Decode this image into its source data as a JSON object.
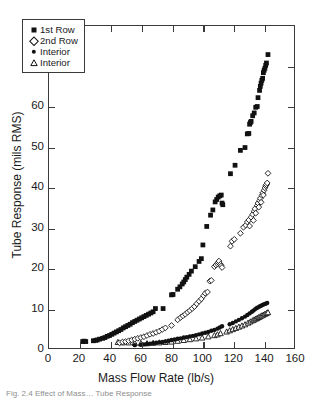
{
  "figure": {
    "caption": "Fig. 2.4  Effect of Mass…  Tube Response"
  },
  "chart_data": {
    "type": "scatter",
    "title": "",
    "xlabel": "Mass Flow Rate (lb/s)",
    "ylabel": "Tube Response (mils RMS)",
    "xlim": [
      0,
      160
    ],
    "ylim": [
      0,
      80
    ],
    "xticks": [
      0,
      20,
      40,
      60,
      80,
      100,
      120,
      140,
      160
    ],
    "yticks": [
      0,
      10,
      20,
      30,
      40,
      50,
      60,
      70,
      80
    ],
    "grid": false,
    "legend_position": "upper left",
    "series": [
      {
        "name": "1st Row",
        "marker": "filled-square",
        "color": "#111111",
        "points": [
          [
            22.0,
            1.6
          ],
          [
            23.0,
            1.7
          ],
          [
            24.0,
            1.6
          ],
          [
            29.0,
            1.8
          ],
          [
            30.5,
            1.9
          ],
          [
            31.5,
            2.0
          ],
          [
            33.0,
            2.2
          ],
          [
            35.0,
            2.4
          ],
          [
            36.5,
            2.6
          ],
          [
            38.0,
            2.9
          ],
          [
            39.5,
            3.1
          ],
          [
            41.0,
            3.4
          ],
          [
            42.5,
            3.7
          ],
          [
            44.0,
            4.0
          ],
          [
            45.5,
            4.3
          ],
          [
            47.0,
            4.6
          ],
          [
            48.5,
            5.0
          ],
          [
            50.0,
            5.3
          ],
          [
            51.5,
            5.6
          ],
          [
            53.0,
            5.9
          ],
          [
            54.5,
            6.3
          ],
          [
            56.0,
            6.6
          ],
          [
            57.5,
            6.9
          ],
          [
            59.0,
            7.2
          ],
          [
            60.5,
            7.5
          ],
          [
            62.0,
            7.8
          ],
          [
            63.5,
            8.1
          ],
          [
            65.0,
            8.4
          ],
          [
            66.5,
            8.7
          ],
          [
            68.0,
            9.0
          ],
          [
            69.5,
            9.8
          ],
          [
            74.5,
            9.8
          ],
          [
            80.0,
            13.2
          ],
          [
            81.0,
            13.3
          ],
          [
            84.0,
            14.6
          ],
          [
            85.5,
            15.2
          ],
          [
            87.0,
            15.9
          ],
          [
            88.0,
            16.4
          ],
          [
            89.0,
            17.0
          ],
          [
            90.0,
            17.6
          ],
          [
            91.5,
            18.3
          ],
          [
            93.0,
            19.1
          ],
          [
            95.5,
            20.2
          ],
          [
            98.0,
            21.5
          ],
          [
            99.5,
            22.2
          ],
          [
            100.5,
            25.6
          ],
          [
            103.0,
            30.2
          ],
          [
            105.5,
            33.0
          ],
          [
            107.0,
            34.3
          ],
          [
            108.5,
            36.3
          ],
          [
            109.5,
            36.9
          ],
          [
            110.5,
            37.5
          ],
          [
            111.5,
            37.8
          ],
          [
            112.5,
            38.0
          ],
          [
            113.0,
            36.0
          ],
          [
            113.5,
            35.6
          ],
          [
            118.5,
            43.3
          ],
          [
            121.5,
            45.4
          ],
          [
            125.0,
            49.1
          ],
          [
            128.0,
            49.8
          ],
          [
            129.5,
            53.2
          ],
          [
            130.5,
            53.3
          ],
          [
            131.0,
            55.6
          ],
          [
            131.5,
            56.0
          ],
          [
            132.0,
            56.3
          ],
          [
            133.0,
            57.7
          ],
          [
            134.0,
            58.4
          ],
          [
            135.0,
            59.8
          ],
          [
            136.0,
            60.0
          ],
          [
            136.5,
            62.2
          ],
          [
            137.5,
            64.0
          ],
          [
            138.0,
            65.0
          ],
          [
            138.5,
            65.8
          ],
          [
            139.0,
            66.5
          ],
          [
            139.5,
            67.0
          ],
          [
            140.0,
            68.4
          ],
          [
            140.5,
            69.0
          ],
          [
            141.0,
            69.5
          ],
          [
            141.5,
            70.2
          ],
          [
            142.0,
            70.8
          ],
          [
            143.0,
            72.9
          ]
        ]
      },
      {
        "name": "2nd Row",
        "marker": "open-diamond",
        "color": "#111111",
        "points": [
          [
            46.0,
            1.3
          ],
          [
            48.0,
            1.5
          ],
          [
            50.0,
            1.6
          ],
          [
            52.0,
            1.8
          ],
          [
            54.0,
            2.0
          ],
          [
            56.0,
            2.2
          ],
          [
            58.0,
            2.4
          ],
          [
            60.0,
            2.6
          ],
          [
            62.0,
            2.8
          ],
          [
            64.0,
            3.1
          ],
          [
            66.0,
            3.4
          ],
          [
            68.0,
            3.6
          ],
          [
            70.0,
            3.9
          ],
          [
            72.0,
            4.2
          ],
          [
            74.0,
            4.6
          ],
          [
            76.0,
            5.0
          ],
          [
            80.0,
            5.6
          ],
          [
            84.0,
            7.0
          ],
          [
            86.0,
            7.6
          ],
          [
            87.5,
            8.0
          ],
          [
            89.0,
            8.4
          ],
          [
            90.5,
            8.9
          ],
          [
            92.0,
            9.3
          ],
          [
            93.5,
            9.8
          ],
          [
            95.0,
            10.3
          ],
          [
            96.5,
            11.0
          ],
          [
            98.0,
            11.6
          ],
          [
            99.5,
            12.2
          ],
          [
            101.0,
            13.0
          ],
          [
            102.0,
            13.6
          ],
          [
            103.5,
            13.9
          ],
          [
            105.0,
            16.6
          ],
          [
            106.0,
            16.8
          ],
          [
            108.0,
            20.2
          ],
          [
            109.0,
            20.6
          ],
          [
            110.0,
            20.9
          ],
          [
            110.5,
            21.3
          ],
          [
            111.0,
            21.6
          ],
          [
            112.0,
            20.8
          ],
          [
            112.5,
            20.4
          ],
          [
            113.0,
            20.0
          ],
          [
            118.5,
            25.3
          ],
          [
            119.5,
            26.5
          ],
          [
            121.0,
            27.0
          ],
          [
            125.0,
            28.5
          ],
          [
            127.0,
            30.0
          ],
          [
            128.5,
            30.5
          ],
          [
            129.5,
            31.3
          ],
          [
            130.5,
            31.8
          ],
          [
            131.0,
            30.3
          ],
          [
            132.0,
            32.5
          ],
          [
            133.0,
            33.2
          ],
          [
            133.5,
            31.7
          ],
          [
            134.0,
            34.0
          ],
          [
            134.5,
            34.6
          ],
          [
            135.0,
            33.5
          ],
          [
            136.0,
            35.4
          ],
          [
            136.5,
            36.0
          ],
          [
            137.0,
            35.0
          ],
          [
            137.5,
            36.6
          ],
          [
            138.0,
            37.2
          ],
          [
            138.5,
            36.2
          ],
          [
            139.0,
            37.9
          ],
          [
            139.5,
            38.5
          ],
          [
            140.0,
            38.0
          ],
          [
            140.5,
            39.2
          ],
          [
            141.0,
            39.8
          ],
          [
            141.5,
            40.3
          ],
          [
            142.0,
            40.6
          ],
          [
            142.5,
            41.0
          ],
          [
            143.0,
            43.4
          ]
        ]
      },
      {
        "name": "Interior",
        "marker": "filled-circle",
        "color": "#111111",
        "points": [
          [
            56.0,
            0.7
          ],
          [
            60.0,
            0.8
          ],
          [
            62.0,
            0.9
          ],
          [
            64.0,
            1.0
          ],
          [
            66.0,
            1.1
          ],
          [
            68.0,
            1.2
          ],
          [
            70.0,
            1.3
          ],
          [
            72.0,
            1.4
          ],
          [
            74.0,
            1.5
          ],
          [
            76.0,
            1.6
          ],
          [
            78.0,
            1.8
          ],
          [
            80.0,
            2.0
          ],
          [
            82.0,
            2.1
          ],
          [
            84.0,
            2.3
          ],
          [
            86.0,
            2.4
          ],
          [
            88.0,
            2.6
          ],
          [
            90.0,
            2.7
          ],
          [
            92.0,
            2.9
          ],
          [
            94.0,
            3.0
          ],
          [
            96.0,
            3.2
          ],
          [
            98.0,
            3.4
          ],
          [
            100.0,
            3.6
          ],
          [
            102.0,
            3.8
          ],
          [
            104.0,
            4.0
          ],
          [
            106.0,
            4.3
          ],
          [
            108.0,
            4.5
          ],
          [
            110.0,
            4.8
          ],
          [
            111.5,
            5.1
          ],
          [
            113.0,
            5.4
          ],
          [
            118.0,
            5.9
          ],
          [
            120.0,
            6.2
          ],
          [
            122.0,
            6.6
          ],
          [
            124.0,
            7.0
          ],
          [
            126.0,
            7.4
          ],
          [
            128.0,
            7.8
          ],
          [
            129.5,
            8.2
          ],
          [
            131.0,
            8.6
          ],
          [
            132.5,
            9.0
          ],
          [
            133.5,
            9.3
          ],
          [
            134.5,
            9.6
          ],
          [
            135.5,
            9.9
          ],
          [
            136.5,
            10.1
          ],
          [
            137.5,
            10.3
          ],
          [
            138.5,
            10.5
          ],
          [
            139.5,
            10.7
          ],
          [
            140.5,
            10.9
          ],
          [
            141.5,
            11.0
          ],
          [
            142.5,
            11.2
          ]
        ]
      },
      {
        "name": "Interior",
        "marker": "open-triangle",
        "color": "#111111",
        "points": [
          [
            45.0,
            1.4
          ],
          [
            48.0,
            1.3
          ],
          [
            52.0,
            1.3
          ],
          [
            56.0,
            1.2
          ],
          [
            60.0,
            1.1
          ],
          [
            64.0,
            1.1
          ],
          [
            68.0,
            1.2
          ],
          [
            72.0,
            1.3
          ],
          [
            76.0,
            1.4
          ],
          [
            80.0,
            1.5
          ],
          [
            84.0,
            1.7
          ],
          [
            88.0,
            1.9
          ],
          [
            92.0,
            2.1
          ],
          [
            96.0,
            2.3
          ],
          [
            100.0,
            2.5
          ],
          [
            104.0,
            2.8
          ],
          [
            108.0,
            3.1
          ],
          [
            110.0,
            3.3
          ],
          [
            112.0,
            3.6
          ],
          [
            116.0,
            4.0
          ],
          [
            118.0,
            4.3
          ],
          [
            120.0,
            4.6
          ],
          [
            122.0,
            4.9
          ],
          [
            124.0,
            5.2
          ],
          [
            126.0,
            5.5
          ],
          [
            128.0,
            5.8
          ],
          [
            130.0,
            6.2
          ],
          [
            131.5,
            6.5
          ],
          [
            133.0,
            6.8
          ],
          [
            134.0,
            7.0
          ],
          [
            135.0,
            7.2
          ],
          [
            136.0,
            7.4
          ],
          [
            137.0,
            7.6
          ],
          [
            138.0,
            7.8
          ],
          [
            139.0,
            8.0
          ],
          [
            140.0,
            8.2
          ],
          [
            141.0,
            8.4
          ],
          [
            142.0,
            8.6
          ],
          [
            143.0,
            8.8
          ]
        ]
      }
    ]
  }
}
